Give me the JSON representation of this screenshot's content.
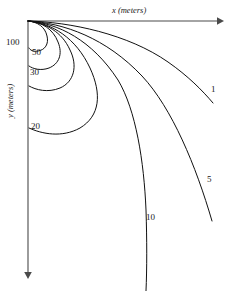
{
  "figure": {
    "title": "",
    "background_color": "#ffffff",
    "curve_color": "#111111",
    "axis_color": "#4a4a4a",
    "width": 231,
    "height": 291
  },
  "axes": {
    "x": {
      "label_var": "x",
      "label_unit": "(meters)",
      "label_full": "x (meters)",
      "direction": "right",
      "has_arrow": true,
      "ticks": []
    },
    "y": {
      "label_var": "y",
      "label_unit": "(meters)",
      "label_full": "y (meters)",
      "direction": "down",
      "has_arrow": true,
      "ticks": []
    }
  },
  "chart_data": {
    "type": "line",
    "title": "",
    "xlabel": "x (meters)",
    "ylabel": "y (meters)",
    "xlim": [
      0,
      200
    ],
    "ylim": [
      0,
      260
    ],
    "y_axis_inverted": true,
    "grid": false,
    "legend": "inline-curve-labels",
    "origin_px": [
      28,
      21
    ],
    "series": [
      {
        "name": "1",
        "label": "1",
        "label_px": [
          212,
          90
        ],
        "path": "M28,21 C70,22 128,34 168,62 C188,76 202,90 213,103",
        "points_px": [
          [
            28,
            21
          ],
          [
            55,
            23
          ],
          [
            85,
            28
          ],
          [
            112,
            36
          ],
          [
            138,
            49
          ],
          [
            160,
            65
          ],
          [
            180,
            82
          ],
          [
            196,
            94
          ],
          [
            213,
            103
          ]
        ]
      },
      {
        "name": "5",
        "label": "5",
        "label_px": [
          208,
          180
        ],
        "path": "M28,21 C64,23 106,38 142,76 C172,108 196,166 212,221",
        "points_px": [
          [
            28,
            21
          ],
          [
            52,
            24
          ],
          [
            76,
            31
          ],
          [
            100,
            44
          ],
          [
            122,
            62
          ],
          [
            142,
            85
          ],
          [
            162,
            120
          ],
          [
            180,
            158
          ],
          [
            196,
            190
          ],
          [
            212,
            221
          ]
        ]
      },
      {
        "name": "10",
        "label": "10",
        "label_px": [
          149,
          218
        ],
        "path": "M28,21 C58,23 92,40 118,80 C136,110 144,162 146,210 C147,240 147,268 146,291",
        "points_px": [
          [
            28,
            21
          ],
          [
            48,
            24
          ],
          [
            68,
            32
          ],
          [
            88,
            48
          ],
          [
            106,
            70
          ],
          [
            120,
            96
          ],
          [
            132,
            128
          ],
          [
            140,
            162
          ],
          [
            145,
            200
          ],
          [
            146,
            240
          ],
          [
            146,
            291
          ]
        ]
      },
      {
        "name": "20",
        "label": "20",
        "label_px": [
          34,
          127
        ],
        "path": "M28,21 C52,23 76,38 90,68 C102,94 100,116 80,128 C62,138 42,134 29,128",
        "points_px": [
          [
            28,
            21
          ],
          [
            44,
            24
          ],
          [
            60,
            32
          ],
          [
            74,
            46
          ],
          [
            86,
            64
          ],
          [
            92,
            84
          ],
          [
            90,
            104
          ],
          [
            80,
            120
          ],
          [
            62,
            130
          ],
          [
            40,
            131
          ],
          [
            29,
            128
          ]
        ]
      },
      {
        "name": "30",
        "label": "30",
        "label_px": [
          30,
          73
        ],
        "path": "M28,21 C46,23 62,32 70,50 C78,66 74,82 60,88 C48,93 36,90 29,86",
        "points_px": [
          [
            28,
            21
          ],
          [
            40,
            23
          ],
          [
            52,
            29
          ],
          [
            62,
            40
          ],
          [
            70,
            54
          ],
          [
            71,
            70
          ],
          [
            64,
            82
          ],
          [
            50,
            89
          ],
          [
            36,
            89
          ],
          [
            29,
            86
          ]
        ]
      },
      {
        "name": "50",
        "label": "50",
        "label_px": [
          32,
          53
        ],
        "path": "M28,21 C42,22 53,29 58,42 C63,54 59,64 49,68 C41,71 33,69 29,66",
        "points_px": [
          [
            28,
            21
          ],
          [
            38,
            23
          ],
          [
            47,
            27
          ],
          [
            55,
            36
          ],
          [
            58,
            48
          ],
          [
            55,
            60
          ],
          [
            47,
            67
          ],
          [
            37,
            69
          ],
          [
            29,
            66
          ]
        ]
      },
      {
        "name": "100",
        "label": "100",
        "label_px": [
          10,
          44
        ],
        "path": "M28,21 C38,22 45,27 47,36 C49,44 45,50 38,51 C33,52 30,50 29,48",
        "points_px": [
          [
            28,
            21
          ],
          [
            35,
            22
          ],
          [
            41,
            26
          ],
          [
            46,
            33
          ],
          [
            47,
            41
          ],
          [
            43,
            48
          ],
          [
            36,
            51
          ],
          [
            30,
            50
          ],
          [
            29,
            48
          ]
        ]
      }
    ],
    "curve_labels": [
      "1",
      "5",
      "10",
      "20",
      "30",
      "50",
      "100"
    ],
    "annotations": []
  },
  "labels": {
    "c1": "1",
    "c5": "5",
    "c10": "10",
    "c20": "20",
    "c30": "30",
    "c50": "50",
    "c100": "100"
  }
}
